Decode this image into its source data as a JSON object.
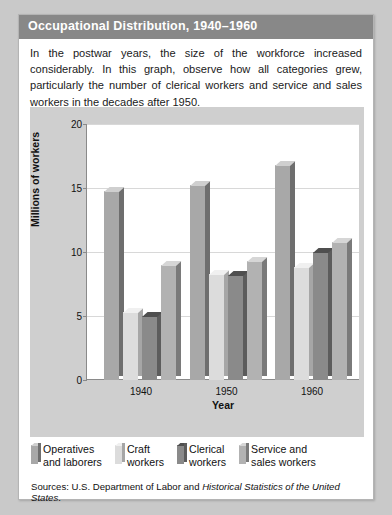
{
  "card": {
    "title": "Occupational Distribution, 1940–1960",
    "intro": "In the postwar years, the size of the workforce increased considerably. In this graph, observe how all categories grew, particularly the number of clerical workers and service and sales workers in the decades after 1950.",
    "sources_prefix": "Sources: U.S. Department of Labor and ",
    "sources_italic": "Historical Statistics of the United States",
    "sources_suffix": "."
  },
  "colors": {
    "header_bar": "#888888",
    "page_background": "#c9c9c9",
    "chart_background": "#cfcfcf",
    "plot_background": "#ffffff",
    "gridline": "#d8d8d8",
    "axis": "#8a8a8a",
    "operatives": "#a8a8a8",
    "operatives_top": "#cfcfcf",
    "operatives_side": "#6e6e6e",
    "craft": "#dcdcdc",
    "craft_top": "#f0f0f0",
    "craft_side": "#a6a6a6",
    "clerical": "#8a8a8a",
    "clerical_top": "#4f4f4f",
    "clerical_side": "#5c5c5c",
    "service": "#b2b2b2",
    "service_top": "#d6d6d6",
    "service_side": "#7a7a7a"
  },
  "chart_data": {
    "type": "bar",
    "title": "Occupational Distribution, 1940–1960",
    "xlabel": "Year",
    "ylabel": "Millions of workers",
    "categories": [
      "1940",
      "1950",
      "1960"
    ],
    "yticks": [
      0,
      5,
      10,
      15,
      20
    ],
    "ylim": [
      0,
      20
    ],
    "grid": true,
    "legend_position": "bottom",
    "series": [
      {
        "name": "Operatives and laborers",
        "legend_label": "Operatives\nand laborers",
        "color_key": "operatives",
        "values": [
          14.8,
          15.2,
          16.8
        ]
      },
      {
        "name": "Craft workers",
        "legend_label": "Craft\nworkers",
        "color_key": "craft",
        "values": [
          5.3,
          8.3,
          8.8
        ]
      },
      {
        "name": "Clerical workers",
        "legend_label": "Clerical\nworkers",
        "color_key": "clerical",
        "values": [
          5.0,
          8.2,
          10.0
        ]
      },
      {
        "name": "Service and sales workers",
        "legend_label": "Service and\nsales workers",
        "color_key": "service",
        "values": [
          9.0,
          9.3,
          10.8
        ]
      }
    ]
  }
}
